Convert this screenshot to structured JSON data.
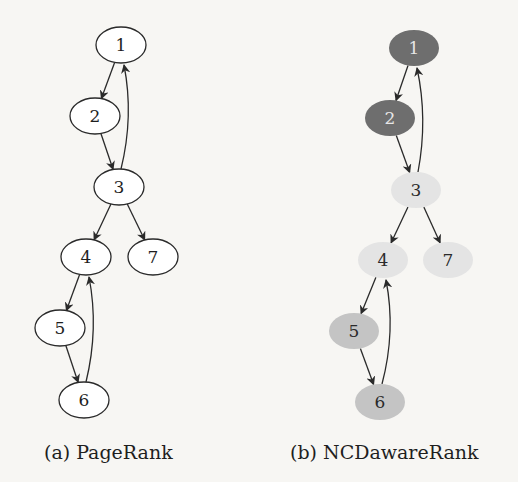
{
  "figure": {
    "panels": [
      {
        "id": "a",
        "caption": "(a) PageRank",
        "style": "outline",
        "nodes": [
          {
            "id": "1",
            "label": "1",
            "cx": 121,
            "cy": 45,
            "fill": "#ffffff",
            "text": "#1e1e1e"
          },
          {
            "id": "2",
            "label": "2",
            "cx": 95,
            "cy": 116,
            "fill": "#ffffff",
            "text": "#1e1e1e"
          },
          {
            "id": "3",
            "label": "3",
            "cx": 119,
            "cy": 187,
            "fill": "#ffffff",
            "text": "#1e1e1e"
          },
          {
            "id": "4",
            "label": "4",
            "cx": 86,
            "cy": 257,
            "fill": "#ffffff",
            "text": "#1e1e1e"
          },
          {
            "id": "7",
            "label": "7",
            "cx": 153,
            "cy": 257,
            "fill": "#ffffff",
            "text": "#1e1e1e"
          },
          {
            "id": "5",
            "label": "5",
            "cx": 60,
            "cy": 328,
            "fill": "#ffffff",
            "text": "#1e1e1e"
          },
          {
            "id": "6",
            "label": "6",
            "cx": 84,
            "cy": 400,
            "fill": "#ffffff",
            "text": "#1e1e1e"
          }
        ]
      },
      {
        "id": "b",
        "caption": "(b) NCDawareRank",
        "style": "filled",
        "nodes": [
          {
            "id": "1",
            "label": "1",
            "cx": 414,
            "cy": 48,
            "fill": "#6e6e6e",
            "text": "#e6e6e6"
          },
          {
            "id": "2",
            "label": "2",
            "cx": 390,
            "cy": 118,
            "fill": "#6e6e6e",
            "text": "#e6e6e6"
          },
          {
            "id": "3",
            "label": "3",
            "cx": 416,
            "cy": 190,
            "fill": "#e4e4e4",
            "text": "#2a2a2a"
          },
          {
            "id": "4",
            "label": "4",
            "cx": 383,
            "cy": 260,
            "fill": "#e4e4e4",
            "text": "#2a2a2a"
          },
          {
            "id": "7",
            "label": "7",
            "cx": 448,
            "cy": 260,
            "fill": "#e4e4e4",
            "text": "#2a2a2a"
          },
          {
            "id": "5",
            "label": "5",
            "cx": 354,
            "cy": 331,
            "fill": "#c4c4c4",
            "text": "#2a2a2a"
          },
          {
            "id": "6",
            "label": "6",
            "cx": 380,
            "cy": 402,
            "fill": "#c4c4c4",
            "text": "#2a2a2a"
          }
        ]
      }
    ],
    "edges": [
      {
        "from": "1",
        "to": "2"
      },
      {
        "from": "2",
        "to": "3"
      },
      {
        "from": "3",
        "to": "1"
      },
      {
        "from": "3",
        "to": "4"
      },
      {
        "from": "3",
        "to": "7"
      },
      {
        "from": "4",
        "to": "5"
      },
      {
        "from": "5",
        "to": "6"
      },
      {
        "from": "6",
        "to": "4"
      }
    ],
    "colors": {
      "edge": "#2a2a2a",
      "outline": "#2a2a2a",
      "background": "#f7f6f3"
    }
  }
}
